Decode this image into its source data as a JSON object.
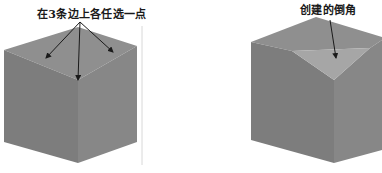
{
  "figures": [
    {
      "id": "left",
      "caption": "在3条边上各任选一点",
      "description": "cube with arrows pointing to one point on each of 3 edges meeting at the top front corner"
    },
    {
      "id": "right",
      "caption": "创建的倒角",
      "description": "cube with the top front corner chamfered into a triangular face"
    }
  ],
  "colors": {
    "top_face": "#8f8f8f",
    "left_face": "#7d7d7d",
    "right_face": "#878787",
    "chamfer_face": "#a6a6a6",
    "arrow": "#1a1a1a",
    "divider": "#d8d8d8"
  }
}
